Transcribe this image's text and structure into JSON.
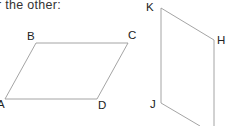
{
  "caption": "r the other:",
  "figures": [
    {
      "name": "parallelogram-ABCD",
      "vertices": {
        "A": [
          5,
          99
        ],
        "B": [
          36,
          43
        ],
        "C": [
          128,
          43
        ],
        "D": [
          97,
          99
        ]
      },
      "labels": [
        "A",
        "B",
        "C",
        "D"
      ]
    },
    {
      "name": "parallelogram-KHJ",
      "vertices": {
        "K": [
          161,
          8
        ],
        "H": [
          214,
          40
        ],
        "J": [
          161,
          103
        ]
      },
      "labels": [
        "K",
        "H",
        "J"
      ]
    }
  ],
  "colors": {
    "line": "#9a9a9a",
    "text": "#222222"
  }
}
